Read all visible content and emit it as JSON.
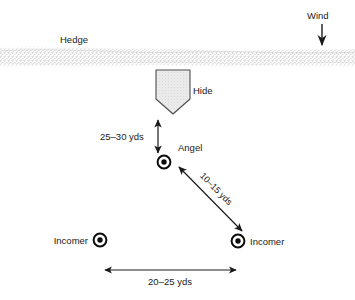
{
  "diagram": {
    "background_color": "#ffffff",
    "line_color": "#1a1a1a",
    "hedge_fill": "#d9d9d9",
    "hide_fill": "#e0e0e0",
    "labels": {
      "hedge": "Hedge",
      "wind": "Wind",
      "hide": "Hide",
      "angel": "Angel",
      "incomer_left": "Incomer",
      "incomer_right": "Incomer"
    },
    "measurements": {
      "hide_to_angel": "25–30 yds",
      "angel_to_incomer": "10–15 yds",
      "incomer_to_incomer": "20–25 yds"
    },
    "markers": [
      {
        "name": "angel",
        "label": "Angel",
        "x": 164,
        "y": 162
      },
      {
        "name": "incomer-left",
        "label": "Incomer",
        "x": 100,
        "y": 240
      },
      {
        "name": "incomer-right",
        "label": "Incomer",
        "x": 238,
        "y": 241
      }
    ]
  }
}
